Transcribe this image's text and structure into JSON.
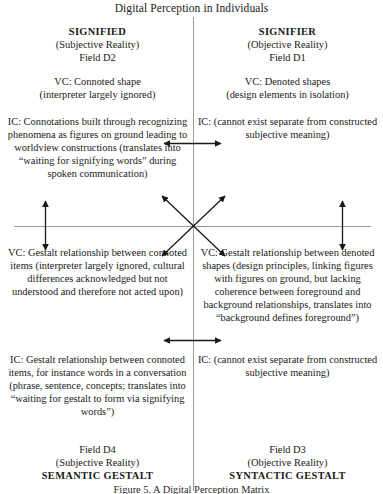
{
  "title": "Digital Perception in Individuals",
  "quadrants": {
    "top_left": {
      "heading": "SIGNIFIED",
      "reality": "(Subjective Reality)",
      "field": "Field D2",
      "vc": "VC: Connoted shape\n(interpreter largely ignored)",
      "ic": "IC: Connotations built through recognizing phenomena as figures on ground leading to worldview constructions (translates into “waiting for signifying words” during spoken communication)"
    },
    "top_right": {
      "heading": "SIGNIFIER",
      "reality": "(Objective Reality)",
      "field": "Field D1",
      "vc": "VC: Denoted shapes\n(design elements in isolation)",
      "ic": "IC: (cannot exist separate from constructed subjective meaning)"
    },
    "bottom_left": {
      "vc": "VC: Gestalt relationship between connoted items (interpreter largely ignored, cultural differences acknowledged but not understood and therefore not acted upon)",
      "ic": "IC: Gestalt relationship between connoted items, for instance words in a conversation (phrase, sentence, concepts; translates into “waiting for gestalt to form via signifying words”)",
      "field": "Field D4",
      "reality": "(Subjective Reality)",
      "heading": "SEMANTIC GESTALT"
    },
    "bottom_right": {
      "vc": "VC: Gestalt relationship between denoted shapes (design principles, linking figures with figures on ground, but lacking coherence between foreground and background relationships, translates into “background defines foreground”)",
      "ic": "IC: (cannot exist separate from constructed subjective meaning)",
      "field": "Field D3",
      "reality": "(Objective Reality)",
      "heading": "SYNTACTIC GESTALT"
    }
  },
  "caption": "Figure 5.  A Digital Perception Matrix",
  "arrows": {
    "upper_horizontal": "double-headed-horizontal-arrow",
    "lower_horizontal": "double-headed-horizontal-arrow",
    "left_vertical": "double-headed-vertical-arrow",
    "right_vertical": "double-headed-vertical-arrow",
    "center_cross": "four-way-diagonal-arrow-cross"
  },
  "colors": {
    "text": "#1a1a1a",
    "axis": "#9a9a9a",
    "arrow": "#1a1a1a",
    "background": "#ffffff"
  }
}
